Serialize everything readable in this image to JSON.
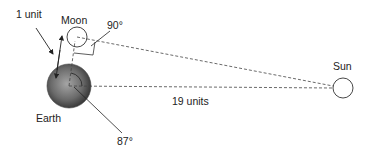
{
  "diagram": {
    "labels": {
      "unit": "1 unit",
      "moon": "Moon",
      "right_angle": "90°",
      "sun": "Sun",
      "distance": "19 units",
      "earth": "Earth",
      "angle": "87°"
    },
    "bodies": {
      "earth": {
        "cx": 69,
        "cy": 86,
        "r": 22
      },
      "moon": {
        "cx": 77,
        "cy": 37,
        "r": 10
      },
      "sun": {
        "cx": 343,
        "cy": 88,
        "r": 10
      }
    },
    "colors": {
      "stroke": "#333333",
      "earth_light": "#9a9a9a",
      "earth_dark": "#2e2e2e",
      "text": "#222222"
    }
  }
}
